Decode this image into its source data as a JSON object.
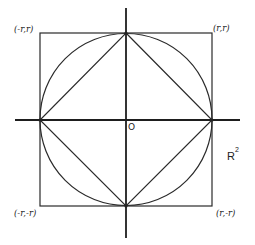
{
  "figure": {
    "corners": {
      "top_left": "(-r,r)",
      "top_right": "(r,r)",
      "bottom_left": "(-r,-r)",
      "bottom_right": "(r,-r)"
    },
    "origin_label": "O",
    "space_label": "R",
    "space_exponent": "2",
    "colors": {
      "line": "#2a2a2a",
      "background": "#ffffff"
    }
  }
}
